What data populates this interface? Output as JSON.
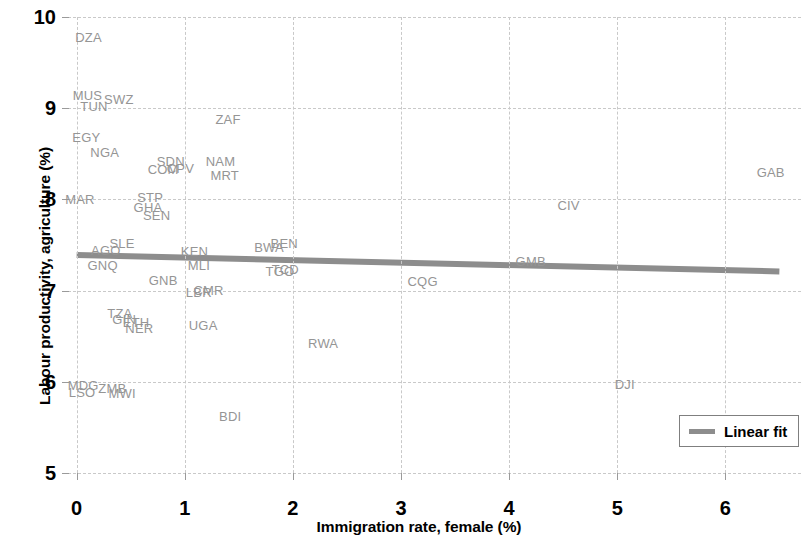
{
  "chart_data": {
    "type": "scatter",
    "title": "",
    "xlabel": "Immigration rate, female (%)",
    "ylabel": "Labour productivity, agriculture (%)",
    "xlim": [
      -0.08,
      6.7
    ],
    "ylim": [
      5,
      10
    ],
    "xticks": [
      0,
      1,
      2,
      3,
      4,
      5,
      6
    ],
    "yticks": [
      5,
      6,
      7,
      8,
      9,
      10
    ],
    "xtick_labels": [
      "0",
      "1",
      "2",
      "3",
      "4",
      "5",
      "6"
    ],
    "ytick_labels": [
      "5",
      "6",
      "7",
      "8",
      "9",
      "10"
    ],
    "grid": true,
    "grid_color": "#c9c9c9",
    "label_color": "#959595",
    "point_marker": "text-label-only",
    "legend": {
      "position": "bottom-right",
      "entries": [
        {
          "label": "Linear fit",
          "color": "#8d8d8d",
          "style": "line"
        }
      ]
    },
    "fit_line": {
      "name": "Linear fit",
      "color": "#8d8d8d",
      "x_start": 0.0,
      "y_start": 7.39,
      "x_end": 6.5,
      "y_end": 7.21,
      "slope": -0.0277,
      "intercept": 7.39
    },
    "points": [
      {
        "label": "DZA",
        "x": 0.11,
        "y": 9.78
      },
      {
        "label": "MUS",
        "x": 0.1,
        "y": 9.14
      },
      {
        "label": "TUN",
        "x": 0.16,
        "y": 9.02
      },
      {
        "label": "SWZ",
        "x": 0.39,
        "y": 9.1
      },
      {
        "label": "ZAF",
        "x": 1.4,
        "y": 8.88
      },
      {
        "label": "EGY",
        "x": 0.09,
        "y": 8.68
      },
      {
        "label": "NGA",
        "x": 0.26,
        "y": 8.52
      },
      {
        "label": "SDN",
        "x": 0.87,
        "y": 8.42
      },
      {
        "label": "NAM",
        "x": 1.33,
        "y": 8.42
      },
      {
        "label": "COM",
        "x": 0.8,
        "y": 8.33
      },
      {
        "label": "CPV",
        "x": 0.96,
        "y": 8.34
      },
      {
        "label": "MRT",
        "x": 1.37,
        "y": 8.27
      },
      {
        "label": "GAB",
        "x": 6.42,
        "y": 8.3
      },
      {
        "label": "MAR",
        "x": 0.03,
        "y": 8.0
      },
      {
        "label": "STP",
        "x": 0.68,
        "y": 8.03
      },
      {
        "label": "GHA",
        "x": 0.66,
        "y": 7.92
      },
      {
        "label": "SEN",
        "x": 0.74,
        "y": 7.83
      },
      {
        "label": "CIV",
        "x": 4.55,
        "y": 7.94
      },
      {
        "label": "SLE",
        "x": 0.42,
        "y": 7.52
      },
      {
        "label": "AGO",
        "x": 0.27,
        "y": 7.45
      },
      {
        "label": "KEN",
        "x": 1.09,
        "y": 7.43
      },
      {
        "label": "BWA",
        "x": 1.78,
        "y": 7.48
      },
      {
        "label": "BEN",
        "x": 1.92,
        "y": 7.52
      },
      {
        "label": "GNQ",
        "x": 0.24,
        "y": 7.28
      },
      {
        "label": "MLI",
        "x": 1.13,
        "y": 7.28
      },
      {
        "label": "GMB",
        "x": 4.2,
        "y": 7.33
      },
      {
        "label": "TCD",
        "x": 1.93,
        "y": 7.24
      },
      {
        "label": "TGO",
        "x": 1.88,
        "y": 7.21
      },
      {
        "label": "GNB",
        "x": 0.8,
        "y": 7.12
      },
      {
        "label": "CQG",
        "x": 3.2,
        "y": 7.11
      },
      {
        "label": "CMR",
        "x": 1.22,
        "y": 7.01
      },
      {
        "label": "LBR",
        "x": 1.13,
        "y": 6.98
      },
      {
        "label": "TZA",
        "x": 0.4,
        "y": 6.75
      },
      {
        "label": "GIN",
        "x": 0.44,
        "y": 6.69
      },
      {
        "label": "ETH",
        "x": 0.55,
        "y": 6.66
      },
      {
        "label": "NER",
        "x": 0.58,
        "y": 6.59
      },
      {
        "label": "UGA",
        "x": 1.17,
        "y": 6.62
      },
      {
        "label": "RWA",
        "x": 2.28,
        "y": 6.43
      },
      {
        "label": "MDG",
        "x": 0.06,
        "y": 5.96
      },
      {
        "label": "LSO",
        "x": 0.05,
        "y": 5.89
      },
      {
        "label": "ZMB",
        "x": 0.33,
        "y": 5.93
      },
      {
        "label": "MWI",
        "x": 0.42,
        "y": 5.88
      },
      {
        "label": "DJI",
        "x": 5.07,
        "y": 5.98
      },
      {
        "label": "BDI",
        "x": 1.42,
        "y": 5.63
      }
    ]
  }
}
